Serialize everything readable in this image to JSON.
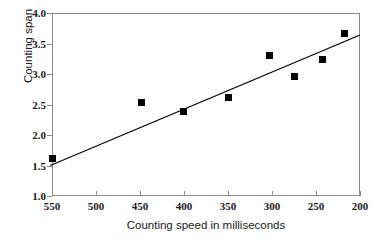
{
  "chart_data": {
    "type": "scatter",
    "title": "",
    "xlabel": "Counting speed in milliseconds",
    "ylabel": "Counting span",
    "xlim": [
      550,
      200
    ],
    "ylim": [
      1.0,
      4.0
    ],
    "x_reversed": true,
    "grid": false,
    "legend": null,
    "xticks": [
      "550",
      "500",
      "450",
      "400",
      "350",
      "300",
      "250",
      "200"
    ],
    "xtick_values": [
      550,
      500,
      450,
      400,
      350,
      300,
      250,
      200
    ],
    "yticks": [
      "1.0",
      "1.5",
      "2.0",
      "2.5",
      "3.0",
      "3.5",
      "4.0"
    ],
    "ytick_values": [
      1.0,
      1.5,
      2.0,
      2.5,
      3.0,
      3.5,
      4.0
    ],
    "series": [
      {
        "name": "Counting span vs speed",
        "marker": "filled-square",
        "color": "#000000",
        "x": [
          550,
          448,
          401,
          349,
          303,
          274,
          243,
          218
        ],
        "y": [
          1.61,
          2.53,
          2.39,
          2.61,
          3.31,
          2.96,
          3.23,
          3.66
        ]
      }
    ],
    "trendline": {
      "type": "linear",
      "color": "#000000",
      "x_start": 552,
      "y_start": 1.5,
      "x_end": 200,
      "y_end": 3.64
    }
  },
  "axis": {
    "frame_color": "#8a8a8a",
    "tick_color": "#8a8a8a",
    "text_color": "#1a1a1a"
  }
}
